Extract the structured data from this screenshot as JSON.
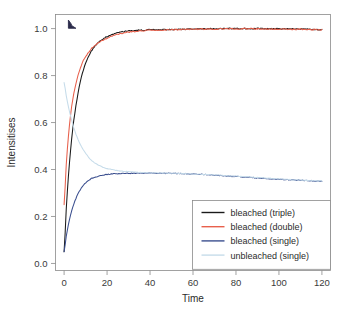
{
  "chart_data": {
    "type": "line",
    "title": "",
    "xlabel": "Time",
    "ylabel": "Intensitises",
    "xlim": [
      -4,
      124
    ],
    "ylim": [
      -0.03,
      1.06
    ],
    "xticks": [
      "0",
      "20",
      "40",
      "60",
      "80",
      "100",
      "120"
    ],
    "xtick_values": [
      0,
      20,
      40,
      60,
      80,
      100,
      120
    ],
    "yticks": [
      "0.0",
      "0.2",
      "0.4",
      "0.6",
      "0.8",
      "1.0"
    ],
    "ytick_values": [
      0.0,
      0.2,
      0.4,
      0.6,
      0.8,
      1.0
    ],
    "grid": false,
    "legend_position": "lower right",
    "series": [
      {
        "name": "bleached (triple)",
        "color": "#1a1a1a",
        "x": [
          0,
          1,
          2,
          3,
          4,
          5,
          6,
          7,
          8,
          9,
          10,
          12,
          14,
          16,
          18,
          20,
          22,
          24,
          26,
          28,
          30,
          35,
          40,
          45,
          50,
          55,
          60,
          65,
          70,
          75,
          80,
          85,
          90,
          95,
          100,
          105,
          110,
          115,
          120
        ],
        "values": [
          0.05,
          0.23,
          0.37,
          0.48,
          0.57,
          0.64,
          0.7,
          0.75,
          0.79,
          0.825,
          0.852,
          0.893,
          0.921,
          0.941,
          0.955,
          0.966,
          0.974,
          0.98,
          0.985,
          0.988,
          0.99,
          0.993,
          0.995,
          0.995,
          0.996,
          0.997,
          0.998,
          0.999,
          0.999,
          1.0,
          1.0,
          1.0,
          1.0,
          0.999,
          0.999,
          0.998,
          0.998,
          0.997,
          0.996
        ]
      },
      {
        "name": "bleached (double)",
        "color": "#e8604c",
        "x": [
          0,
          1,
          2,
          3,
          4,
          5,
          6,
          7,
          8,
          9,
          10,
          12,
          14,
          16,
          18,
          20,
          22,
          24,
          26,
          28,
          30,
          35,
          40,
          45,
          50,
          55,
          60,
          65,
          70,
          75,
          80,
          85,
          90,
          95,
          100,
          105,
          110,
          115,
          120
        ],
        "values": [
          0.25,
          0.42,
          0.54,
          0.63,
          0.695,
          0.745,
          0.785,
          0.817,
          0.843,
          0.864,
          0.881,
          0.907,
          0.925,
          0.939,
          0.95,
          0.959,
          0.967,
          0.973,
          0.978,
          0.982,
          0.985,
          0.99,
          0.993,
          0.994,
          0.995,
          0.996,
          0.997,
          0.998,
          0.998,
          0.999,
          0.999,
          0.999,
          0.999,
          0.998,
          0.998,
          0.997,
          0.997,
          0.996,
          0.995
        ]
      },
      {
        "name": "bleached (single)",
        "color": "#3b4f8f",
        "x": [
          0,
          1,
          2,
          3,
          4,
          5,
          6,
          7,
          8,
          9,
          10,
          12,
          14,
          16,
          18,
          20,
          22,
          24,
          26,
          28,
          30,
          35,
          40,
          45,
          50,
          55,
          60,
          65,
          70,
          75,
          80,
          85,
          90,
          95,
          100,
          105,
          110,
          115,
          120
        ],
        "values": [
          0.05,
          0.115,
          0.165,
          0.205,
          0.238,
          0.265,
          0.288,
          0.306,
          0.321,
          0.333,
          0.343,
          0.357,
          0.366,
          0.372,
          0.376,
          0.379,
          0.381,
          0.382,
          0.383,
          0.383,
          0.384,
          0.385,
          0.385,
          0.384,
          0.384,
          0.383,
          0.381,
          0.379,
          0.376,
          0.373,
          0.37,
          0.367,
          0.364,
          0.361,
          0.358,
          0.356,
          0.354,
          0.352,
          0.35
        ]
      },
      {
        "name": "unbleached (single)",
        "color": "#c6dcea",
        "x": [
          0,
          1,
          2,
          3,
          4,
          5,
          6,
          7,
          8,
          9,
          10,
          12,
          14,
          16,
          18,
          20,
          22,
          24,
          26,
          28,
          30,
          35,
          40,
          45,
          50,
          55,
          60,
          65,
          70,
          75,
          80,
          85,
          90,
          95,
          100,
          105,
          110,
          115,
          120
        ],
        "values": [
          0.77,
          0.715,
          0.668,
          0.628,
          0.594,
          0.564,
          0.539,
          0.517,
          0.498,
          0.482,
          0.468,
          0.446,
          0.43,
          0.419,
          0.41,
          0.404,
          0.4,
          0.397,
          0.394,
          0.392,
          0.391,
          0.388,
          0.386,
          0.385,
          0.384,
          0.383,
          0.381,
          0.379,
          0.377,
          0.374,
          0.372,
          0.369,
          0.366,
          0.363,
          0.36,
          0.357,
          0.355,
          0.353,
          0.351
        ]
      }
    ],
    "annotations": [
      {
        "name": "corner-mark",
        "x": 2.0,
        "y": 1.015
      }
    ]
  },
  "legend": {
    "items": [
      {
        "label": "bleached (triple)",
        "color": "#1a1a1a"
      },
      {
        "label": "bleached (double)",
        "color": "#e8604c"
      },
      {
        "label": "bleached (single)",
        "color": "#3b4f8f"
      },
      {
        "label": "unbleached (single)",
        "color": "#c6dcea"
      }
    ]
  },
  "axes": {
    "x_title": "Time",
    "y_title": "Intensitises"
  }
}
